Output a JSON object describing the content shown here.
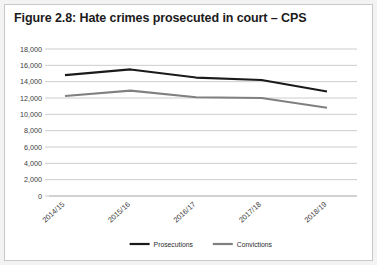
{
  "figure": {
    "title": "Figure 2.8: Hate crimes prosecuted in court – CPS"
  },
  "chart_data": {
    "type": "line",
    "title": "Figure 2.8: Hate crimes prosecuted in court – CPS",
    "xlabel": "",
    "ylabel": "",
    "categories": [
      "2014/15",
      "2015/16",
      "2016/17",
      "2017/18",
      "2018/19"
    ],
    "series": [
      {
        "name": "Prosecutions",
        "color": "#1a1a1a",
        "values": [
          14800,
          15500,
          14500,
          14200,
          12800
        ]
      },
      {
        "name": "Convictions",
        "color": "#808080",
        "values": [
          12250,
          12900,
          12100,
          12000,
          10800
        ]
      }
    ],
    "ylim": [
      0,
      18000
    ],
    "ytick_step": 2000,
    "ytick_labels": [
      "0",
      "2,000",
      "4,000",
      "6,000",
      "8,000",
      "10,000",
      "12,000",
      "14,000",
      "16,000",
      "18,000"
    ],
    "grid": true,
    "legend_position": "bottom"
  },
  "legend": {
    "items": [
      {
        "label": "Prosecutions",
        "color": "#1a1a1a"
      },
      {
        "label": "Convictions",
        "color": "#808080"
      }
    ]
  }
}
